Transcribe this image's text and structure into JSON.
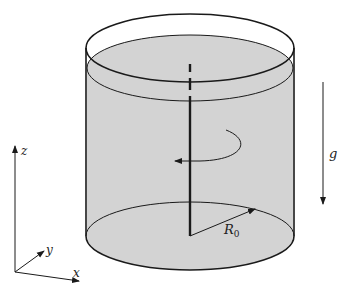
{
  "figure": {
    "colors": {
      "fluid": "#d3d3d3",
      "stroke": "#1a1a1a",
      "background": "#ffffff"
    }
  },
  "labels": {
    "radius": "R",
    "radius_subscript": "0",
    "gravity": "g",
    "axis_x": "x",
    "axis_y": "y",
    "axis_z": "z"
  },
  "elements": {
    "cylinder": "open-top cylinder",
    "fluid_surface": "flat free surface",
    "rotation_axis": "vertical center axis (dashed above fluid, solid below)",
    "rotation_arrow": "counter-clockwise rotation indicator",
    "radius_arrow": "radius from center of base to rim",
    "gravity_arrow": "downward gravity vector",
    "coordinate_axes": "x, y, z reference frame"
  }
}
